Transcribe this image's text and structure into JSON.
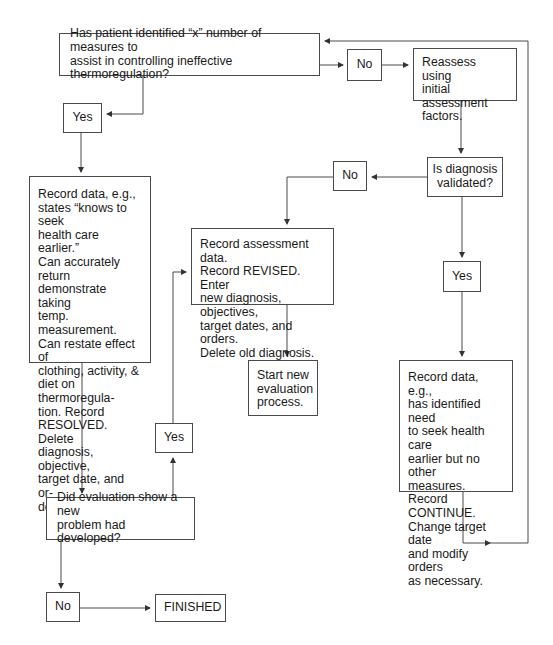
{
  "nodes": {
    "q_measures": "Has patient identified “x” number of measures to\nassist in controlling ineffective thermoregulation?",
    "no_top": "No",
    "reassess": "Reassess using\ninitial assessment\nfactors.",
    "yes_left": "Yes",
    "resolved": "Record data, e.g.,\nstates “knows to seek\nhealth care earlier.”\nCan accurately return\ndemonstrate taking\ntemp. measurement.\nCan restate effect of\nclothing, activity, &\ndiet on thermoregula-\ntion. Record\nRESOLVED. Delete\ndiagnosis, objective,\ntarget date, and or-\nders.",
    "q_validated": "Is diagnosis\nvalidated?",
    "no_mid": "No",
    "revised": "Record assessment data.\nRecord REVISED. Enter\nnew diagnosis, objectives,\ntarget dates, and orders.\nDelete old diagnosis.",
    "start_new": "Start new\nevaluation\nprocess.",
    "yes_right": "Yes",
    "continue": "Record data, e.g.,\nhas identified need\nto seek health care\nearlier but no other\nmeasures. Record\nCONTINUE.\nChange target date\nand modify orders\nas necessary.",
    "yes_bottom": "Yes",
    "q_new_problem": "Did evaluation show a new\nproblem had developed?",
    "no_bottom": "No",
    "finished": "FINISHED"
  },
  "colors": {
    "line": "#4a4a4a",
    "text": "#1a1a1a",
    "background": "#ffffff"
  }
}
